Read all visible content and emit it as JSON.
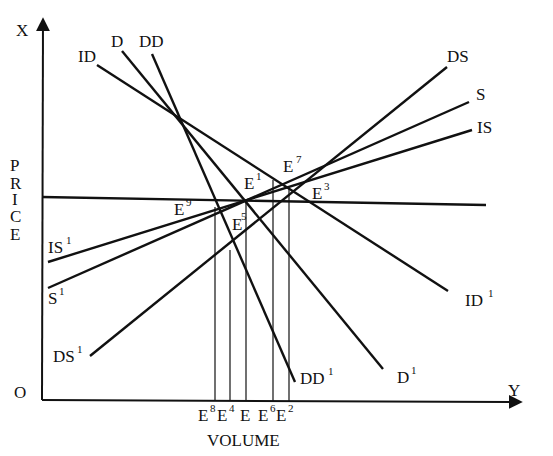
{
  "diagram": {
    "type": "supply-demand",
    "axes": {
      "vertical_top_label": "X",
      "horizontal_right_label": "Y",
      "origin_label": "O",
      "vertical_title": "PRICE",
      "vertical_title_letters": [
        "P",
        "R",
        "I",
        "C",
        "E"
      ],
      "horizontal_title": "VOLUME"
    },
    "curves": [
      {
        "id": "ID",
        "start_label": "ID",
        "end_label": "ID",
        "end_sup": "1",
        "kind": "demand"
      },
      {
        "id": "D",
        "start_label": "D",
        "end_label": "D",
        "end_sup": "1",
        "kind": "demand"
      },
      {
        "id": "DD",
        "start_label": "DD",
        "end_label": "DD",
        "end_sup": "1",
        "kind": "demand"
      },
      {
        "id": "DS",
        "start_label": "DS",
        "start_sup": "1",
        "end_label": "DS",
        "kind": "supply"
      },
      {
        "id": "S",
        "start_label": "S",
        "start_sup": "1",
        "end_label": "S",
        "kind": "supply"
      },
      {
        "id": "IS",
        "start_label": "IS",
        "start_sup": "1",
        "end_label": "IS",
        "kind": "supply"
      }
    ],
    "price_line": {
      "label": "horizontal price level"
    },
    "equilibrium_points": [
      {
        "base": "E",
        "sup": "1"
      },
      {
        "base": "E",
        "sup": "3"
      },
      {
        "base": "E",
        "sup": "5"
      },
      {
        "base": "E",
        "sup": "7"
      },
      {
        "base": "E",
        "sup": "9"
      }
    ],
    "volume_ticks": [
      {
        "base": "E",
        "sup": "8"
      },
      {
        "base": "E",
        "sup": "4"
      },
      {
        "base": "E",
        "sup": ""
      },
      {
        "base": "E",
        "sup": "6"
      },
      {
        "base": "E",
        "sup": "2"
      }
    ]
  }
}
